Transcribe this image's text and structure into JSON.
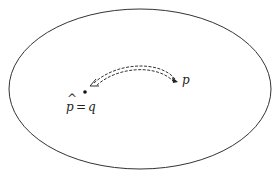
{
  "diagram": {
    "region": {
      "shape": "ellipse",
      "stroke": "#333333"
    },
    "points": [
      {
        "id": "p",
        "label": "p"
      },
      {
        "id": "q",
        "label_hat": "p",
        "label_eq": "=",
        "label_rhs": "q"
      }
    ],
    "arrow": {
      "from": "p",
      "to": "q",
      "style": "dashed-double"
    },
    "colors": {
      "ink": "#222222",
      "background": "#ffffff"
    }
  }
}
